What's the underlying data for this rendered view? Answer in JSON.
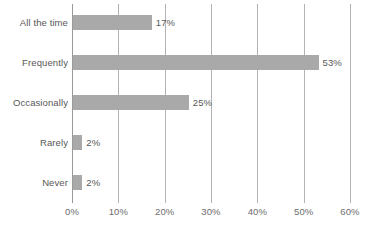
{
  "chart_data": {
    "type": "bar",
    "orientation": "horizontal",
    "title": "",
    "subtitle": "",
    "xlabel": "",
    "ylabel": "",
    "categories": [
      "All the time",
      "Frequently",
      "Occasionally",
      "Rarely",
      "Never"
    ],
    "values": [
      17,
      53,
      25,
      2,
      2
    ],
    "data_labels": [
      "17%",
      "53%",
      "25%",
      "2%",
      "2%"
    ],
    "xlim": [
      0,
      60
    ],
    "xtick_values": [
      0,
      10,
      20,
      30,
      40,
      50,
      60
    ],
    "xtick_labels": [
      "0%",
      "10%",
      "20%",
      "30%",
      "40%",
      "50%",
      "60%"
    ],
    "grid": {
      "vertical": true,
      "horizontal": false
    },
    "legend": {
      "visible": false,
      "position": "none"
    },
    "colors": {
      "bar": "#a9a9a9",
      "gridline": "#b3b3b3",
      "axis": "#9a9a9a",
      "label_text": "#585858",
      "tick_text": "#6d6d6d",
      "background": "#ffffff"
    }
  }
}
